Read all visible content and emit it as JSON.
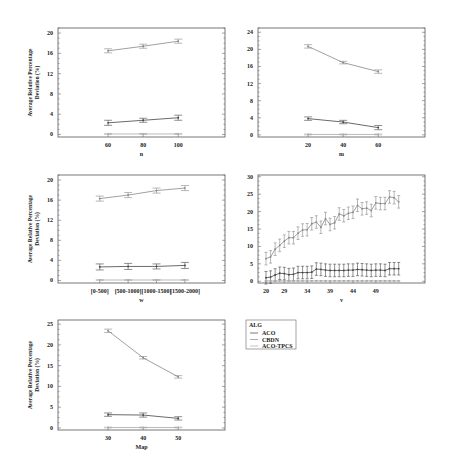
{
  "figure": {
    "ylabel_line1": "Average Relative Percentage",
    "ylabel_line2": "Deviation (%)"
  },
  "legend": {
    "title": "ALG",
    "entries": [
      {
        "label": "ACO",
        "color": "#444444"
      },
      {
        "label": "CBDN",
        "color": "#888888"
      },
      {
        "label": "ACO-TPCS",
        "color": "#aaaaaa"
      }
    ]
  },
  "chart_data": [
    {
      "type": "line",
      "id": "n",
      "xlabel": "n",
      "ylabel": "Average Relative Percentage Deviation (%)",
      "categories": [
        "60",
        "80",
        "100"
      ],
      "yticks": [
        0,
        4,
        8,
        12,
        16,
        20
      ],
      "ylim": [
        -0.5,
        21
      ],
      "series": [
        {
          "name": "CBDN",
          "values": [
            16.5,
            17.4,
            18.4
          ],
          "err": [
            0.4,
            0.4,
            0.4
          ]
        },
        {
          "name": "ACO",
          "values": [
            2.3,
            2.8,
            3.3
          ],
          "err": [
            0.5,
            0.4,
            0.5
          ]
        },
        {
          "name": "ACO-TPCS",
          "values": [
            0.1,
            0.1,
            0.1
          ],
          "err": [
            0.1,
            0.1,
            0.1
          ]
        }
      ]
    },
    {
      "type": "line",
      "id": "m",
      "xlabel": "m",
      "ylabel": "",
      "categories": [
        "20",
        "40",
        "60"
      ],
      "yticks": [
        0,
        4,
        8,
        12,
        16,
        20,
        24
      ],
      "ylim": [
        -0.5,
        25
      ],
      "series": [
        {
          "name": "CBDN",
          "values": [
            20.7,
            16.9,
            14.8
          ],
          "err": [
            0.4,
            0.3,
            0.4
          ]
        },
        {
          "name": "ACO",
          "values": [
            3.8,
            3.0,
            1.7
          ],
          "err": [
            0.4,
            0.4,
            0.5
          ]
        },
        {
          "name": "ACO-TPCS",
          "values": [
            0.1,
            0.1,
            0.1
          ],
          "err": [
            0.1,
            0.1,
            0.1
          ]
        }
      ]
    },
    {
      "type": "line",
      "id": "w",
      "xlabel": "w",
      "ylabel": "Average Relative Percentage Deviation (%)",
      "categories": [
        "[0-500]",
        "[500-1000]",
        "[1000-1500]",
        "[1500-2000]"
      ],
      "yticks": [
        0,
        4,
        8,
        12,
        16,
        20
      ],
      "ylim": [
        -0.5,
        21
      ],
      "series": [
        {
          "name": "CBDN",
          "values": [
            16.3,
            17.0,
            17.9,
            18.4
          ],
          "err": [
            0.5,
            0.5,
            0.5,
            0.5
          ]
        },
        {
          "name": "ACO",
          "values": [
            2.7,
            2.8,
            2.8,
            3.0
          ],
          "err": [
            0.6,
            0.6,
            0.5,
            0.6
          ]
        },
        {
          "name": "ACO-TPCS",
          "values": [
            0.1,
            0.1,
            0.1,
            0.1
          ],
          "err": [
            0.1,
            0.1,
            0.1,
            0.1
          ]
        }
      ]
    },
    {
      "type": "line",
      "id": "v",
      "xlabel": "v",
      "ylabel": "",
      "x": [
        20,
        21,
        22,
        23,
        24,
        25,
        26,
        27,
        28,
        29,
        30,
        31,
        32,
        33,
        34,
        35,
        36,
        37,
        38,
        39,
        40,
        41,
        42,
        43,
        44,
        45,
        46,
        47,
        48,
        49,
        50,
        51,
        52,
        53
      ],
      "xticks": [
        20,
        29,
        34,
        39,
        44,
        49
      ],
      "xtick_positions": [
        20,
        24,
        29,
        34,
        39,
        44
      ],
      "yticks": [
        0,
        5,
        10,
        15,
        20,
        25,
        30
      ],
      "ylim": [
        -0.5,
        30.5
      ],
      "series": [
        {
          "name": "CBDN",
          "values": [
            6.5,
            7.0,
            9.2,
            10.3,
            11.5,
            12.5,
            12.5,
            13.8,
            14.7,
            14.8,
            16.5,
            17.0,
            15.5,
            18.0,
            16.3,
            16.8,
            19.3,
            18.8,
            19.5,
            19.8,
            21.8,
            20.8,
            21.0,
            20.3,
            22.5,
            22.3,
            22.3,
            24.2,
            24.0,
            22.8
          ],
          "err": 1.8
        },
        {
          "name": "ACO",
          "values": [
            1.0,
            1.2,
            1.8,
            2.3,
            2.2,
            1.9,
            2.0,
            2.5,
            2.5,
            2.5,
            2.6,
            3.5,
            3.4,
            3.2,
            3.1,
            3.1,
            3.1,
            3.1,
            3.2,
            3.2,
            3.4,
            3.3,
            3.2,
            3.1,
            3.2,
            3.2,
            3.1,
            3.6,
            3.6,
            3.6
          ],
          "err": 1.8
        },
        {
          "name": "ACO-TPCS",
          "values": [
            0.1,
            0.1,
            0.1,
            0.1,
            0.1,
            0.1,
            0.1,
            0.1,
            0.1,
            0.1,
            0.1,
            0.1,
            0.1,
            0.1,
            0.1,
            0.1,
            0.1,
            0.1,
            0.1,
            0.1,
            0.1,
            0.1,
            0.1,
            0.1,
            0.1,
            0.1,
            0.1,
            0.1,
            0.1,
            0.1
          ],
          "err": 0.1
        }
      ]
    },
    {
      "type": "line",
      "id": "map",
      "xlabel": "Map",
      "ylabel": "Average Relative Percentage Deviation (%)",
      "categories": [
        "30",
        "40",
        "50"
      ],
      "yticks": [
        0,
        5,
        10,
        15,
        20,
        25
      ],
      "ylim": [
        -0.5,
        26
      ],
      "series": [
        {
          "name": "CBDN",
          "values": [
            23.4,
            16.9,
            12.3
          ],
          "err": [
            0.4,
            0.3,
            0.3
          ]
        },
        {
          "name": "ACO",
          "values": [
            3.2,
            3.1,
            2.3
          ],
          "err": [
            0.4,
            0.5,
            0.4
          ]
        },
        {
          "name": "ACO-TPCS",
          "values": [
            0.1,
            0.1,
            0.1
          ],
          "err": [
            0.1,
            0.1,
            0.1
          ]
        }
      ]
    }
  ]
}
